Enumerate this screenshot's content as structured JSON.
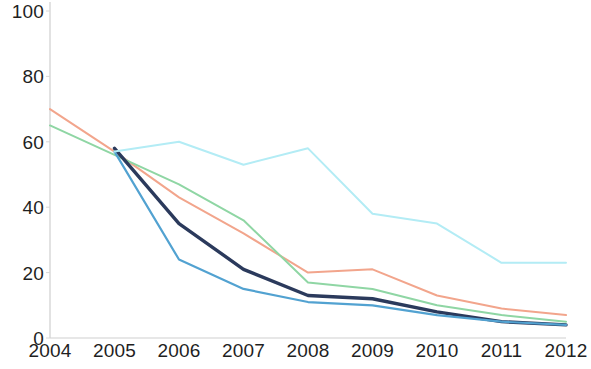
{
  "chart_data": {
    "type": "line",
    "title": "",
    "subtitle": "",
    "xlabel": "",
    "ylabel": "",
    "x": [
      2004,
      2005,
      2006,
      2007,
      2008,
      2009,
      2010,
      2011,
      2012
    ],
    "categories": [
      "2004",
      "2005",
      "2006",
      "2007",
      "2008",
      "2009",
      "2010",
      "2011",
      "2012"
    ],
    "xlim": [
      2004,
      2012
    ],
    "ylim": [
      0,
      100
    ],
    "y_ticks": [
      0,
      20,
      40,
      60,
      80,
      100
    ],
    "y_tick_labels": [
      "0",
      "20",
      "40",
      "60",
      "80",
      "100"
    ],
    "x_tick_labels": [
      "2004",
      "2005",
      "2006",
      "2007",
      "2008",
      "2009",
      "2010",
      "2011",
      "2012"
    ],
    "grid": false,
    "legend": "none",
    "series": [
      {
        "name": "series-salmon",
        "color": "#f2a58c",
        "width": 2.0,
        "x": [
          2004,
          2005,
          2006,
          2007,
          2008,
          2009,
          2010,
          2011,
          2012
        ],
        "values": [
          70,
          57,
          43,
          32,
          20,
          21,
          13,
          9,
          7
        ]
      },
      {
        "name": "series-green",
        "color": "#8fd6a4",
        "width": 2.0,
        "x": [
          2004,
          2005,
          2006,
          2007,
          2008,
          2009,
          2010,
          2011,
          2012
        ],
        "values": [
          65,
          56,
          47,
          36,
          17,
          15,
          10,
          7,
          5
        ]
      },
      {
        "name": "series-navy",
        "color": "#2b3a5c",
        "width": 3.4,
        "x": [
          2005,
          2006,
          2007,
          2008,
          2009,
          2010,
          2011,
          2012
        ],
        "values": [
          58,
          35,
          21,
          13,
          12,
          8,
          5,
          4
        ]
      },
      {
        "name": "series-blue",
        "color": "#52a2d1",
        "width": 2.2,
        "x": [
          2005,
          2006,
          2007,
          2008,
          2009,
          2010,
          2011,
          2012
        ],
        "values": [
          57,
          24,
          15,
          11,
          10,
          7,
          5,
          4
        ]
      },
      {
        "name": "series-cyan",
        "color": "#b3ecf5",
        "width": 2.0,
        "x": [
          2005,
          2006,
          2007,
          2008,
          2009,
          2010,
          2011,
          2012
        ],
        "values": [
          57,
          60,
          53,
          58,
          38,
          35,
          23,
          23
        ]
      }
    ],
    "axes": {
      "left_axis_color": "#cfcfcf",
      "bottom_axis_color": "#cfcfcf"
    }
  }
}
